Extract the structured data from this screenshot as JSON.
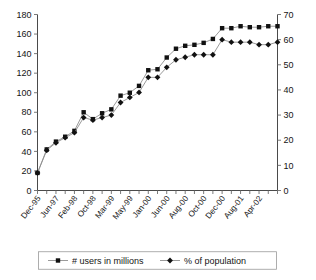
{
  "chart_data": {
    "type": "line",
    "title": "",
    "subtitle": "",
    "xlabel": "",
    "ylabel": "",
    "grid": false,
    "legend_position": "bottom",
    "x": [
      "Dec-95",
      "Jun-96",
      "Jun-97",
      "Dec-97",
      "Feb-98",
      "Jun-98",
      "Oct-98",
      "Dec-98",
      "Feb-99",
      "Mar-99",
      "Apr-99",
      "May-99",
      "Aug-99",
      "Oct-99",
      "Jan-00",
      "Mar-00",
      "Jun-00",
      "Jul-00",
      "Aug-00",
      "Sep-00",
      "Oct-00",
      "Nov-00",
      "Dec-00",
      "Apr-01",
      "Aug-01",
      "Dec-01",
      "Apr-02"
    ],
    "xtick_labels": [
      "Dec-95",
      "Jun-97",
      "Feb-98",
      "Oct-98",
      "Mar-99",
      "May-99",
      "Jan-00",
      "Jun-00",
      "Aug-00",
      "Oct-00",
      "Dec-00",
      "Aug-01",
      "Apr-02"
    ],
    "xtick_stride": 2,
    "left_axis": {
      "label": "# users in millions",
      "ticks": [
        0,
        20,
        40,
        60,
        80,
        100,
        120,
        140,
        160,
        180
      ],
      "min": 0,
      "max": 180
    },
    "right_axis": {
      "label": "% of population",
      "ticks": [
        0,
        10,
        20,
        30,
        40,
        50,
        60,
        70
      ],
      "min": 0,
      "max": 70
    },
    "series": [
      {
        "name": "# users in millions",
        "marker": "square",
        "color": "#111111",
        "axis": "left",
        "values": [
          18,
          42,
          50,
          55,
          61,
          80,
          73,
          79,
          83,
          97,
          100,
          107,
          123,
          124,
          136,
          145,
          148,
          149,
          151,
          155,
          166,
          166,
          168,
          167,
          167,
          168,
          168
        ]
      },
      {
        "name": "% of population",
        "marker": "diamond",
        "color": "#111111",
        "axis": "right",
        "values": [
          7,
          16,
          19,
          21,
          23,
          29,
          28,
          29,
          30,
          35,
          37,
          39,
          45,
          45,
          49,
          52,
          53,
          54,
          54,
          54,
          60,
          59,
          59,
          59,
          58,
          58,
          59
        ]
      }
    ]
  },
  "legend": {
    "items": [
      {
        "label": "# users in millions",
        "marker": "square"
      },
      {
        "label": "% of population",
        "marker": "diamond"
      }
    ]
  }
}
